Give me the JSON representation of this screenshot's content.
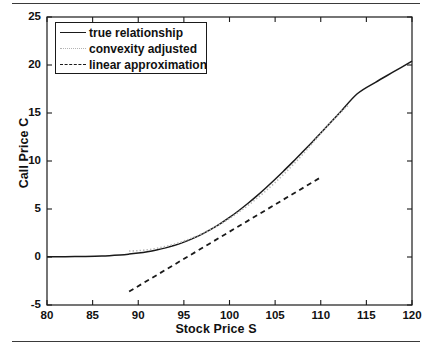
{
  "chart_data": {
    "type": "line",
    "title": "",
    "xlabel": "Stock Price S",
    "ylabel": "Call Price C",
    "xlim": [
      80,
      120
    ],
    "ylim": [
      -5,
      25
    ],
    "xticks": [
      80,
      85,
      90,
      95,
      100,
      105,
      110,
      115,
      120
    ],
    "yticks": [
      -5,
      0,
      5,
      10,
      15,
      20,
      25
    ],
    "grid": false,
    "legend_position": "top-left",
    "series": [
      {
        "name": "true relationship",
        "style": "solid",
        "color": "#1a1a1a",
        "x": [
          80,
          82,
          84,
          86,
          88,
          89,
          90,
          91,
          92,
          93,
          94,
          95,
          96,
          97,
          98,
          99,
          100,
          101,
          102,
          103,
          104,
          105,
          106,
          107,
          108,
          109,
          110,
          112,
          114,
          116,
          118,
          120
        ],
        "y": [
          0.02,
          0.03,
          0.06,
          0.11,
          0.22,
          0.3,
          0.41,
          0.55,
          0.73,
          0.95,
          1.22,
          1.55,
          1.94,
          2.39,
          2.9,
          3.48,
          4.12,
          4.82,
          5.57,
          6.37,
          7.22,
          8.1,
          9.02,
          9.96,
          10.93,
          11.91,
          12.91,
          14.94,
          17.0,
          18.2,
          19.3,
          20.4
        ]
      },
      {
        "name": "convexity adjusted",
        "style": "dotted",
        "color": "#b4b4b4",
        "x": [
          89,
          90,
          91,
          92,
          93,
          94,
          95,
          96,
          97,
          98,
          99,
          100,
          101,
          102,
          103,
          104,
          105,
          106,
          107,
          108,
          109,
          110,
          111,
          112,
          113
        ],
        "y": [
          0.62,
          0.66,
          0.75,
          0.9,
          1.1,
          1.35,
          1.66,
          2.02,
          2.44,
          2.91,
          3.44,
          4.02,
          4.66,
          5.35,
          6.1,
          6.9,
          7.76,
          8.67,
          9.64,
          10.66,
          11.74,
          12.87,
          13.9,
          14.9,
          15.8
        ]
      },
      {
        "name": "linear approximation",
        "style": "dashed",
        "color": "#1a1a1a",
        "x": [
          89,
          110
        ],
        "y": [
          -3.6,
          8.3
        ]
      }
    ]
  },
  "legend": {
    "items": [
      {
        "label": "true relationship"
      },
      {
        "label": "convexity adjusted"
      },
      {
        "label": "linear approximation"
      }
    ]
  },
  "axes": {
    "x_label": "Stock Price S",
    "y_label": "Call Price C",
    "x_tick_labels": [
      "80",
      "85",
      "90",
      "95",
      "100",
      "105",
      "110",
      "115",
      "120"
    ],
    "y_tick_labels": [
      "-5",
      "0",
      "5",
      "10",
      "15",
      "20",
      "25"
    ]
  }
}
